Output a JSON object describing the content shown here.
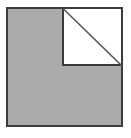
{
  "figure": {
    "type": "geometric-diagram",
    "canvas": {
      "width": 131,
      "height": 138,
      "background_color": "#ffffff"
    },
    "colors": {
      "shaded_fill": "#ababab",
      "notch_fill": "#ffffff",
      "outline": "#3c3c3c",
      "diagonal": "#555555"
    },
    "outer_square": {
      "name": "large-shaded-square",
      "x": 6,
      "y": 7,
      "width": 117,
      "height": 120,
      "fill": "#ababab",
      "stroke": "#3c3c3c",
      "stroke_width": 2
    },
    "notch_square": {
      "name": "white-corner-square",
      "x": 62,
      "y": 7,
      "width": 61,
      "height": 59,
      "fill": "#ffffff",
      "stroke": "#3c3c3c",
      "stroke_width": 2,
      "position": "top-right"
    },
    "diagonal": {
      "name": "notch-diagonal",
      "x1": 63,
      "y1": 8,
      "x2": 122,
      "y2": 66,
      "stroke": "#555555",
      "stroke_width": 1.6,
      "from": "top-left of white square",
      "to": "bottom-right of white square"
    },
    "labels": []
  }
}
